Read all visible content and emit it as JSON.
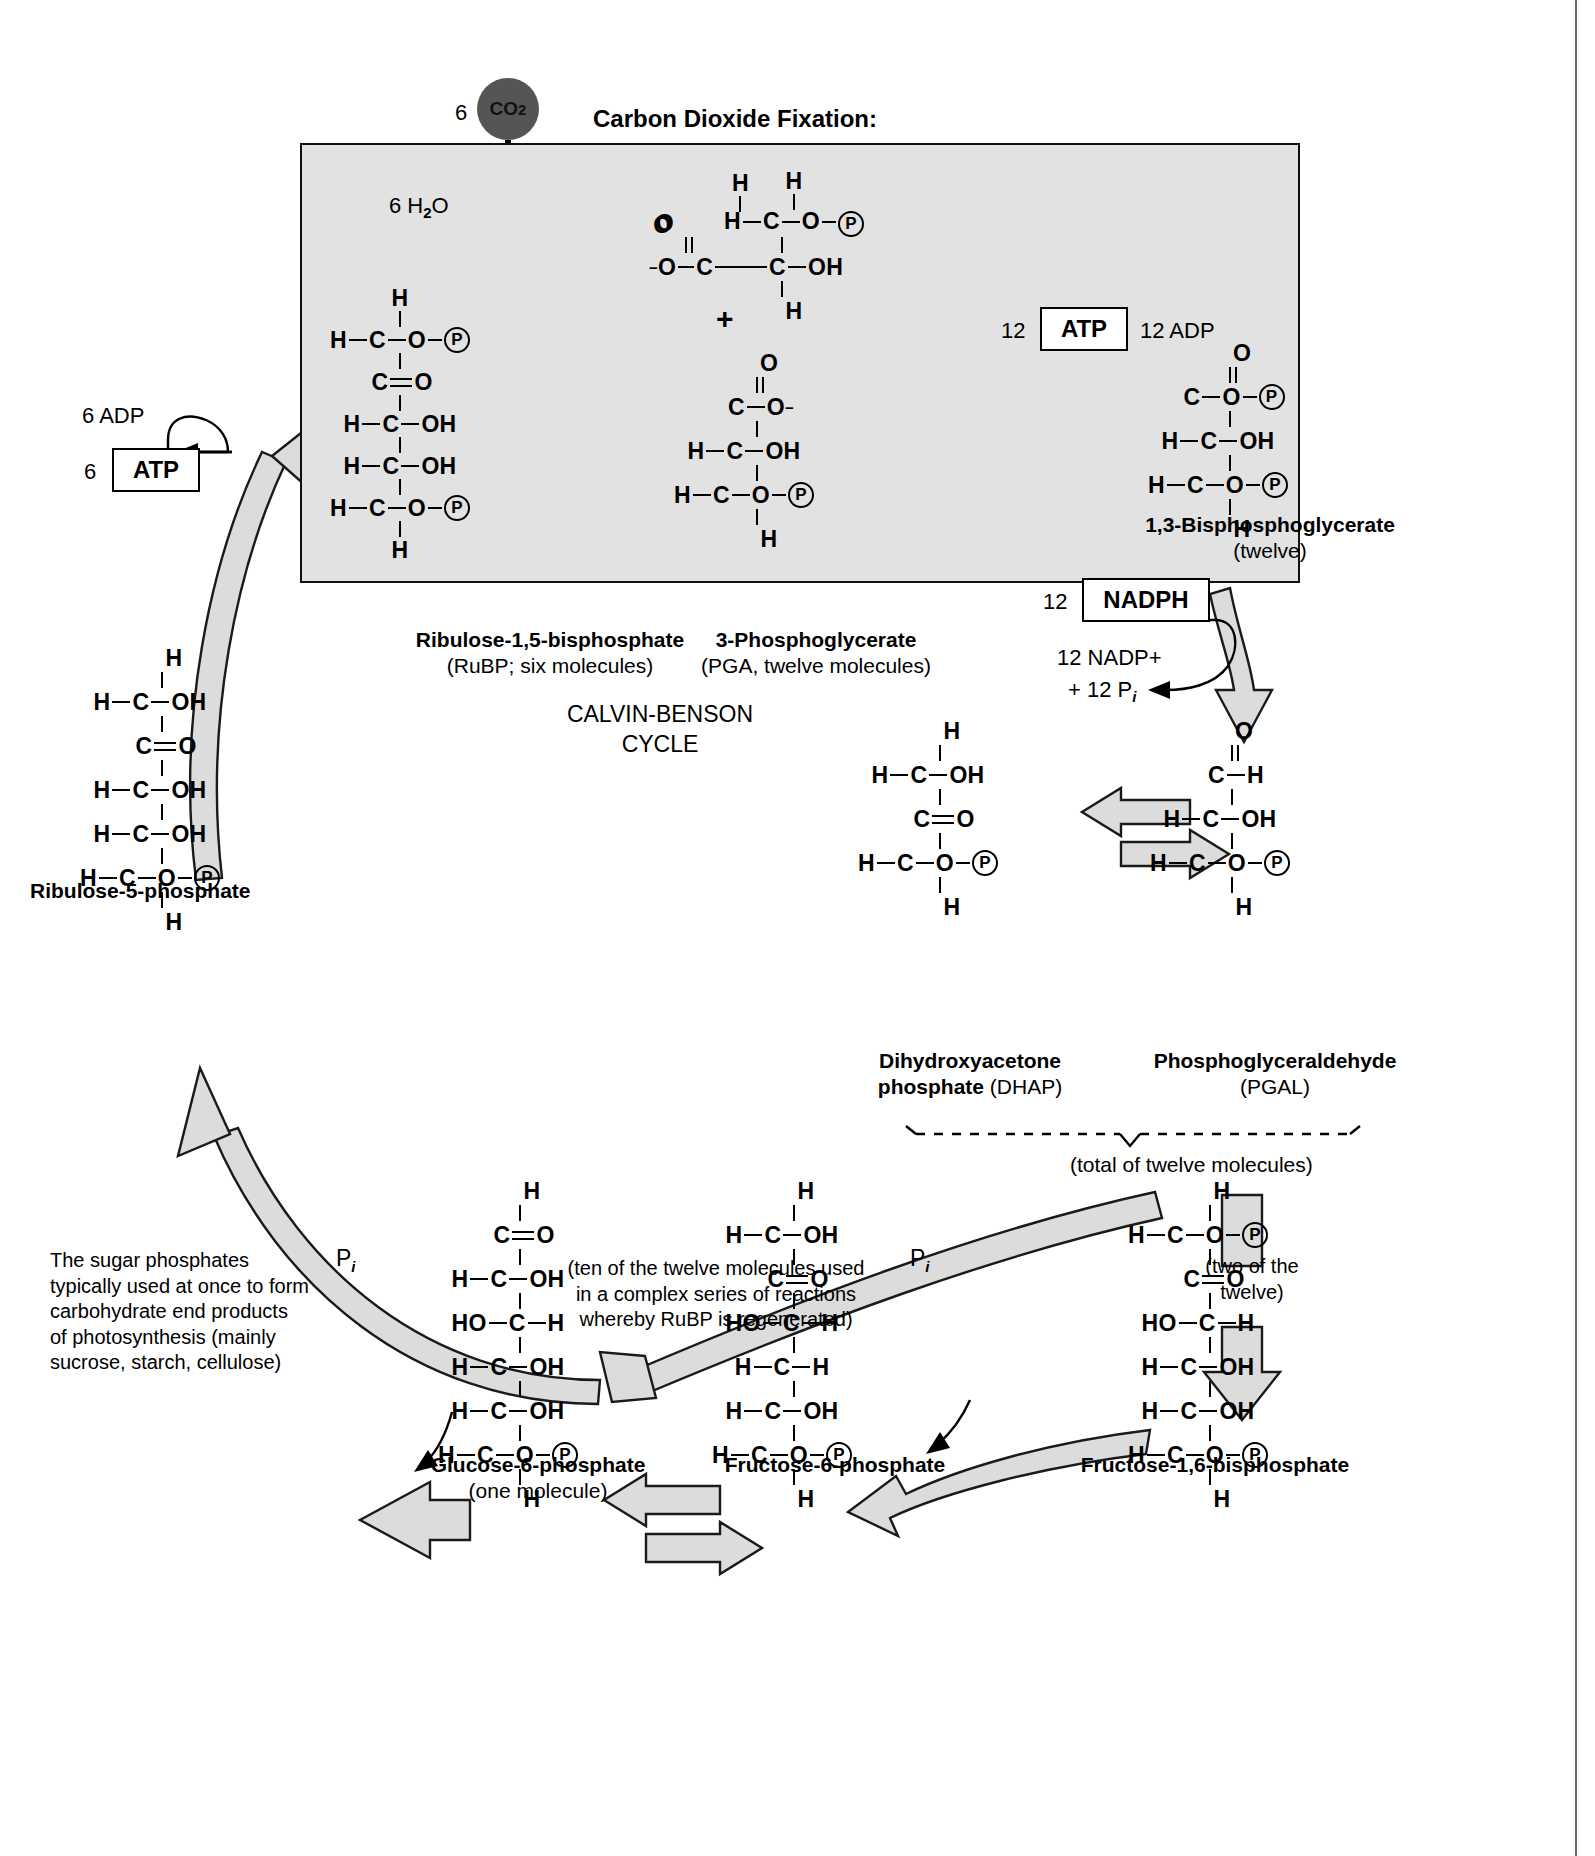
{
  "diagram": {
    "title": "CALVIN-BENSON CYCLE",
    "section_heading": "Carbon Dioxide Fixation:"
  },
  "inputs": {
    "co2_count": "6",
    "co2_label": "CO",
    "co2_sub": "2",
    "water_label": "6 H",
    "water_sub": "2",
    "water_tail": "O"
  },
  "cofactors": {
    "atp_left_count": "6",
    "atp_left_label": "ATP",
    "adp_left_label": "6 ADP",
    "atp_right_count": "12",
    "atp_right_label": "ATP",
    "adp_right_label": "12 ADP",
    "nadph_count": "12",
    "nadph_label": "NADPH",
    "nadp_out_line1": "12 NADP+",
    "nadp_out_line2": "+ 12 P",
    "nadp_out_sub": "i",
    "pi_label": "P",
    "pi_sub": "i"
  },
  "molecules": {
    "rubp": {
      "name": "Ribulose-1,5-bisphosphate",
      "detail": "(RuBP; six molecules)"
    },
    "pga": {
      "name": "3-Phosphoglycerate",
      "detail": "(PGA, twelve molecules)"
    },
    "bpg": {
      "name": "1,3-Bisphosphoglycerate",
      "detail": "(twelve)"
    },
    "pgal": {
      "name": "Phosphoglyceraldehyde",
      "detail": "(PGAL)"
    },
    "dhap": {
      "name_line1": "Dihydroxyacetone",
      "name_line2": "phosphate",
      "detail": "(DHAP)"
    },
    "ru5p": {
      "name": "Ribulose-5-phosphate"
    },
    "fbp": {
      "name": "Fructose-1,6-bisphosphate"
    },
    "f6p": {
      "name": "Fructose-6-phosphate"
    },
    "g6p": {
      "name": "Glucose-6-phosphate",
      "detail": "(one molecule)"
    }
  },
  "annotations": {
    "total_twelve": "(total of twelve molecules)",
    "two_of_twelve_line1": "(two of the",
    "two_of_twelve_line2": "twelve)",
    "regeneration_line1": "(ten of the twelve molecules used",
    "regeneration_line2": "in a complex series of reactions",
    "regeneration_line3": "whereby RuBP is regenerated)",
    "end_products_line1": "The sugar phosphates",
    "end_products_line2": "typically used at once to form",
    "end_products_line3": "carbohydrate end products",
    "end_products_line4": "of photosynthesis (mainly",
    "end_products_line5": "sucrose, starch, cellulose)"
  },
  "atoms": {
    "H": "H",
    "C": "C",
    "O": "O",
    "OH": "OH",
    "HO": "HO",
    "P": "P",
    "O_minus": "O",
    "minus": "−"
  },
  "colors": {
    "shade_box_fill": "#e2e2e2",
    "arrow_fill": "#dcdcdc",
    "stroke": "#000000",
    "co2_fill": "#555555"
  }
}
